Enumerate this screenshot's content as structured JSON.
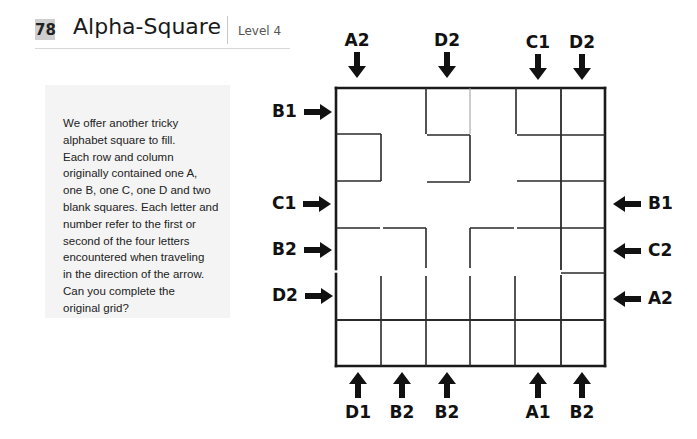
{
  "header": {
    "puzzle_number": "78",
    "title": "Alpha-Square",
    "level": "Level 4"
  },
  "instructions": "We offer another tricky\nalphabet square to fill.\nEach row and column\noriginally contained one A,\none B, one C, one D and two\nblank squares. Each letter and\nnumber refer to the first or\nsecond of the four letters\nencountered when traveling\nin the direction of the arrow.\nCan you complete the\noriginal grid?",
  "grid": {
    "rows": 6,
    "cols": 6,
    "cells": [
      [
        "",
        "",
        "",
        "",
        "",
        ""
      ],
      [
        "",
        "",
        "",
        "",
        "",
        ""
      ],
      [
        "",
        "",
        "",
        "",
        "",
        ""
      ],
      [
        "",
        "",
        "",
        "",
        "",
        ""
      ],
      [
        "",
        "",
        "",
        "",
        "",
        ""
      ],
      [
        "",
        "",
        "",
        "",
        "",
        ""
      ]
    ]
  },
  "clues": {
    "top": [
      {
        "col": 0,
        "label": "A2",
        "icon": "arrow-down-icon"
      },
      {
        "col": 2,
        "label": "D2",
        "icon": "arrow-down-icon"
      },
      {
        "col": 4,
        "label": "C1",
        "icon": "arrow-down-icon"
      },
      {
        "col": 5,
        "label": "D2",
        "icon": "arrow-down-icon"
      }
    ],
    "bottom": [
      {
        "col": 0,
        "label": "D1",
        "icon": "arrow-up-icon"
      },
      {
        "col": 1,
        "label": "B2",
        "icon": "arrow-up-icon"
      },
      {
        "col": 2,
        "label": "B2",
        "icon": "arrow-up-icon"
      },
      {
        "col": 4,
        "label": "A1",
        "icon": "arrow-up-icon"
      },
      {
        "col": 5,
        "label": "B2",
        "icon": "arrow-up-icon"
      }
    ],
    "left": [
      {
        "row": 0,
        "label": "B1",
        "icon": "arrow-right-icon"
      },
      {
        "row": 2,
        "label": "C1",
        "icon": "arrow-right-icon"
      },
      {
        "row": 3,
        "label": "B2",
        "icon": "arrow-right-icon"
      },
      {
        "row": 4,
        "label": "D2",
        "icon": "arrow-right-icon"
      }
    ],
    "right": [
      {
        "row": 2,
        "label": "B1",
        "icon": "arrow-left-icon"
      },
      {
        "row": 3,
        "label": "C2",
        "icon": "arrow-left-icon"
      },
      {
        "row": 4,
        "label": "A2",
        "icon": "arrow-left-icon"
      }
    ]
  }
}
